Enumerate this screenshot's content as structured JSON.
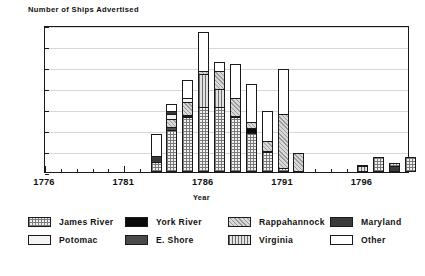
{
  "chart_data": {
    "type": "bar",
    "subtype": "stacked-vertical",
    "title": "",
    "ylabel": "Number of Ships Advertised",
    "xlabel": "Year",
    "ylim": [
      0,
      35
    ],
    "yticks": [
      0,
      5,
      10,
      15,
      20,
      25,
      30,
      35
    ],
    "xlim": [
      1776,
      1799
    ],
    "xticks_labeled": [
      1776,
      1781,
      1786,
      1791,
      1796
    ],
    "grid": true,
    "legend_position": "bottom",
    "categories": [
      1776,
      1777,
      1778,
      1779,
      1780,
      1781,
      1782,
      1783,
      1784,
      1785,
      1786,
      1787,
      1788,
      1789,
      1790,
      1791,
      1792,
      1793,
      1794,
      1795,
      1796,
      1797,
      1798
    ],
    "series": [
      {
        "name": "James River",
        "key": "james",
        "values": [
          0,
          0,
          0,
          0,
          0,
          0,
          0,
          2.5,
          10,
          13,
          15.5,
          15.5,
          13,
          11,
          6.5,
          1,
          0,
          0,
          0,
          0,
          0,
          0,
          0
        ]
      },
      {
        "name": "York River",
        "key": "york",
        "values": [
          0,
          0,
          0,
          0,
          0,
          0,
          0,
          0,
          0,
          0.5,
          0,
          0,
          0.5,
          1.5,
          0.5,
          0,
          0,
          0,
          0,
          0,
          0,
          0,
          0
        ]
      },
      {
        "name": "Rappahannock",
        "key": "rappahannock",
        "values": [
          0,
          0,
          0,
          0,
          0,
          0,
          0,
          0,
          2,
          3.5,
          1,
          4.5,
          4.5,
          2,
          3.5,
          13,
          4.5,
          0,
          0,
          0,
          0,
          2,
          0
        ]
      },
      {
        "name": "Maryland",
        "key": "maryland",
        "values": [
          0,
          0,
          0,
          0,
          0,
          0,
          0,
          1.5,
          1,
          0,
          0,
          0,
          0,
          0,
          0,
          0,
          0,
          0,
          0,
          0,
          0,
          1.5,
          0
        ]
      },
      {
        "name": "Potomac",
        "key": "potomac",
        "values": [
          0,
          0,
          0,
          0,
          0,
          0,
          0,
          0,
          1.5,
          1,
          0,
          0,
          0,
          0,
          0,
          0,
          0,
          0,
          0,
          0,
          0,
          0,
          0
        ]
      },
      {
        "name": "E. Shore",
        "key": "eshore",
        "values": [
          0,
          0,
          0,
          0,
          0,
          0,
          0,
          0,
          1,
          0.5,
          0,
          0,
          0,
          0,
          0,
          0,
          0,
          0,
          0,
          0,
          0,
          0,
          0
        ]
      },
      {
        "name": "Virginia",
        "key": "virginia",
        "values": [
          0,
          0,
          0,
          0,
          0,
          0,
          0,
          0,
          0,
          0,
          8,
          4.5,
          0,
          0,
          0,
          0,
          0,
          0,
          0,
          0,
          1.5,
          0,
          3.5
        ]
      },
      {
        "name": "Other",
        "key": "other",
        "values": [
          0,
          0,
          0,
          0,
          0,
          0,
          0,
          5.5,
          2,
          4.5,
          9.5,
          2.5,
          8.5,
          11,
          10.5,
          11,
          0,
          0,
          0,
          0,
          0.5,
          0,
          0
        ]
      }
    ],
    "bars": [
      {
        "year": 1783,
        "total": 9.5,
        "stack": [
          {
            "key": "james",
            "v": 2.5
          },
          {
            "key": "maryland",
            "v": 1.5
          },
          {
            "key": "other",
            "v": 5.5
          }
        ]
      },
      {
        "year": 1784,
        "total": 17.5,
        "stack": [
          {
            "key": "james",
            "v": 10
          },
          {
            "key": "eshore",
            "v": 1
          },
          {
            "key": "rappahannock",
            "v": 2
          },
          {
            "key": "potomac",
            "v": 1.5
          },
          {
            "key": "maryland",
            "v": 1
          },
          {
            "key": "other",
            "v": 2
          }
        ]
      },
      {
        "year": 1785,
        "total": 23.0,
        "stack": [
          {
            "key": "james",
            "v": 13
          },
          {
            "key": "york",
            "v": 0.5
          },
          {
            "key": "eshore",
            "v": 0.5
          },
          {
            "key": "rappahannock",
            "v": 3.5
          },
          {
            "key": "potomac",
            "v": 1
          },
          {
            "key": "other",
            "v": 4.5
          }
        ]
      },
      {
        "year": 1786,
        "total": 34.0,
        "stack": [
          {
            "key": "james",
            "v": 15.5
          },
          {
            "key": "virginia",
            "v": 8
          },
          {
            "key": "rappahannock",
            "v": 1
          },
          {
            "key": "other",
            "v": 9.5
          }
        ]
      },
      {
        "year": 1787,
        "total": 27.0,
        "stack": [
          {
            "key": "james",
            "v": 15.5
          },
          {
            "key": "virginia",
            "v": 4.5
          },
          {
            "key": "rappahannock",
            "v": 4.5
          },
          {
            "key": "other",
            "v": 2.5
          }
        ]
      },
      {
        "year": 1788,
        "total": 26.0,
        "stack": [
          {
            "key": "james",
            "v": 13
          },
          {
            "key": "york",
            "v": 0.5
          },
          {
            "key": "rappahannock",
            "v": 4.5
          },
          {
            "key": "other",
            "v": 8.5
          }
        ]
      },
      {
        "year": 1789,
        "total": 21.0,
        "stack": [
          {
            "key": "james",
            "v": 11
          },
          {
            "key": "york",
            "v": 1.5
          },
          {
            "key": "rappahannock",
            "v": 2
          },
          {
            "key": "other",
            "v": 11
          }
        ]
      },
      {
        "year": 1790,
        "total": 14.5,
        "stack": [
          {
            "key": "james",
            "v": 6.5
          },
          {
            "key": "york",
            "v": 0.5
          },
          {
            "key": "rappahannock",
            "v": 3.5
          },
          {
            "key": "other",
            "v": 10.5
          }
        ]
      },
      {
        "year": 1791,
        "total": 25.0,
        "stack": [
          {
            "key": "james",
            "v": 1
          },
          {
            "key": "rappahannock",
            "v": 13
          },
          {
            "key": "other",
            "v": 11
          }
        ]
      },
      {
        "year": 1792,
        "total": 4.5,
        "stack": [
          {
            "key": "rappahannock",
            "v": 4.5
          }
        ]
      },
      {
        "year": 1796,
        "total": 2.0,
        "stack": [
          {
            "key": "virginia",
            "v": 1.5
          },
          {
            "key": "other",
            "v": 0.5
          }
        ]
      },
      {
        "year": 1797,
        "total": 3.5,
        "stack": [
          {
            "key": "james",
            "v": 3.5
          }
        ]
      },
      {
        "year": 1798,
        "total": 2.5,
        "stack": [
          {
            "key": "maryland",
            "v": 1.5
          },
          {
            "key": "james",
            "v": 1
          }
        ]
      },
      {
        "year": 1799,
        "total": 3.5,
        "stack": [
          {
            "key": "james",
            "v": 3.5
          }
        ]
      }
    ]
  },
  "axes": {
    "ylabel": "Number of Ships Advertised",
    "xlabel": "Year",
    "yticks": [
      "0",
      "5",
      "10",
      "15",
      "20",
      "25",
      "30",
      "35"
    ],
    "xticks": [
      "1776",
      "1781",
      "1786",
      "1791",
      "1796"
    ]
  },
  "legend": {
    "items": [
      {
        "label": "James River",
        "key": "james"
      },
      {
        "label": "York River",
        "key": "york"
      },
      {
        "label": "Rappahannock",
        "key": "rappahannock"
      },
      {
        "label": "Maryland",
        "key": "maryland"
      },
      {
        "label": "Potomac",
        "key": "potomac"
      },
      {
        "label": "E. Shore",
        "key": "eshore"
      },
      {
        "label": "Virginia",
        "key": "virginia"
      },
      {
        "label": "Other",
        "key": "other"
      }
    ]
  },
  "colors": {
    "axis": "#1a1a1a",
    "grid": "#d8d8d8",
    "background": "#ffffff"
  }
}
